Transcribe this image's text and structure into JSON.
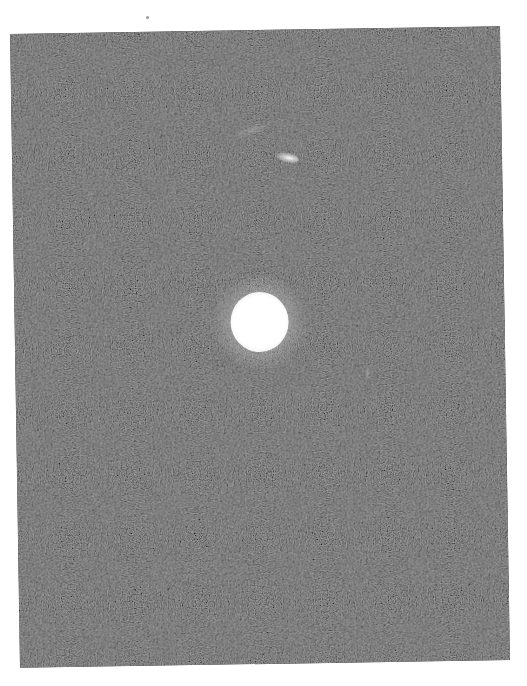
{
  "image": {
    "description": "Scanned grainy black-and-white astronomical photograph showing a bright saturated point source with a faint elongated streak above it",
    "background_color": "#565656",
    "paper_color": "#ffffff",
    "photo_frame": {
      "left": 15,
      "top": 30,
      "width": 490,
      "height": 634,
      "rotation_deg": -0.9
    },
    "objects": [
      {
        "name": "bright-source",
        "cx": 245,
        "cy": 292,
        "core_radius": 28,
        "halo_radius": 48,
        "color": "#ffffff"
      },
      {
        "name": "faint-streak",
        "cx": 275,
        "cy": 128,
        "width": 24,
        "height": 10,
        "color": "#e6e6e6"
      },
      {
        "name": "faint-arc",
        "cx": 240,
        "cy": 100,
        "width": 40,
        "height": 10
      },
      {
        "name": "faint-mark",
        "cx": 352,
        "cy": 345,
        "width": 5,
        "height": 14
      }
    ],
    "scan_artifacts": [
      {
        "name": "dust-dot",
        "x": 146,
        "y": 16
      }
    ]
  }
}
